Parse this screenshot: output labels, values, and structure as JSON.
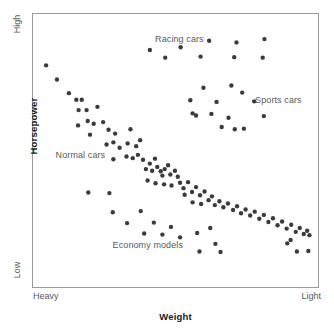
{
  "chart_data": {
    "type": "scatter",
    "title": "",
    "xlabel": "Weight",
    "ylabel": "Horsepower",
    "xlim": [
      0,
      100
    ],
    "ylim": [
      0,
      100
    ],
    "grid": false,
    "legend_position": "none",
    "x_tick_labels": [
      "Heavy",
      "Light"
    ],
    "y_tick_labels": [
      "Low",
      "High"
    ],
    "annotations": [
      {
        "text": "Racing cars",
        "x": 51.0,
        "y": 90.5
      },
      {
        "text": "Sports cars",
        "x": 85.5,
        "y": 68.5
      },
      {
        "text": "Normal cars",
        "x": 16.5,
        "y": 48.5
      },
      {
        "text": "Economy models",
        "x": 40.0,
        "y": 15.5
      }
    ],
    "marker": {
      "shape": "circle",
      "radius_px": 2.2,
      "color": "#3b3b3b"
    },
    "series": [
      {
        "name": "Normal cars",
        "points": [
          [
            4.6,
            81.2
          ],
          [
            8.4,
            76.0
          ],
          [
            12.6,
            71.0
          ],
          [
            15.2,
            68.6
          ],
          [
            17.1,
            68.6
          ],
          [
            16.0,
            64.8
          ],
          [
            18.8,
            64.8
          ],
          [
            22.6,
            66.0
          ],
          [
            15.8,
            59.2
          ],
          [
            19.2,
            60.8
          ],
          [
            21.3,
            59.8
          ],
          [
            24.6,
            60.4
          ],
          [
            20.0,
            55.8
          ],
          [
            26.5,
            57.6
          ],
          [
            28.8,
            56.2
          ],
          [
            34.2,
            57.8
          ],
          [
            25.8,
            52.2
          ],
          [
            28.2,
            53.0
          ],
          [
            30.4,
            51.0
          ],
          [
            33.2,
            52.6
          ],
          [
            36.2,
            51.6
          ],
          [
            37.6,
            53.8
          ],
          [
            28.2,
            46.8
          ],
          [
            32.8,
            47.8
          ],
          [
            35.0,
            47.2
          ],
          [
            36.8,
            48.4
          ],
          [
            38.6,
            46.6
          ],
          [
            41.0,
            45.2
          ],
          [
            42.8,
            47.0
          ],
          [
            39.6,
            43.2
          ],
          [
            41.8,
            42.6
          ],
          [
            43.6,
            44.0
          ],
          [
            44.8,
            42.4
          ],
          [
            46.2,
            43.2
          ],
          [
            47.4,
            44.6
          ],
          [
            45.4,
            40.8
          ],
          [
            48.2,
            41.2
          ],
          [
            49.8,
            42.6
          ],
          [
            50.8,
            40.4
          ],
          [
            40.2,
            39.0
          ],
          [
            43.0,
            38.0
          ],
          [
            46.0,
            37.6
          ],
          [
            48.6,
            37.2
          ],
          [
            51.6,
            38.2
          ],
          [
            52.8,
            36.2
          ],
          [
            54.4,
            38.4
          ],
          [
            53.2,
            33.8
          ],
          [
            55.8,
            34.8
          ],
          [
            57.2,
            36.6
          ],
          [
            58.6,
            33.6
          ],
          [
            60.2,
            35.0
          ],
          [
            56.0,
            31.0
          ],
          [
            59.0,
            30.4
          ],
          [
            61.6,
            31.8
          ],
          [
            62.8,
            33.2
          ],
          [
            63.8,
            30.0
          ],
          [
            65.4,
            31.4
          ],
          [
            66.8,
            29.2
          ],
          [
            68.4,
            30.6
          ],
          [
            70.2,
            28.2
          ],
          [
            71.6,
            29.6
          ],
          [
            73.0,
            27.0
          ],
          [
            74.6,
            28.4
          ],
          [
            76.2,
            26.2
          ],
          [
            77.8,
            27.6
          ],
          [
            79.4,
            25.0
          ],
          [
            81.0,
            26.4
          ],
          [
            82.6,
            23.8
          ],
          [
            84.2,
            25.2
          ],
          [
            85.8,
            22.6
          ],
          [
            87.4,
            24.0
          ],
          [
            89.0,
            21.4
          ],
          [
            90.6,
            22.8
          ],
          [
            92.2,
            20.2
          ],
          [
            93.6,
            21.6
          ],
          [
            95.0,
            19.4
          ],
          [
            96.2,
            20.6
          ],
          [
            97.0,
            19.0
          ]
        ]
      },
      {
        "name": "Racing cars",
        "points": [
          [
            41.0,
            86.8
          ],
          [
            51.8,
            87.8
          ],
          [
            61.8,
            90.2
          ],
          [
            71.4,
            89.6
          ],
          [
            81.2,
            90.8
          ],
          [
            46.4,
            84.0
          ],
          [
            58.8,
            84.4
          ],
          [
            70.6,
            84.2
          ],
          [
            80.6,
            84.0
          ]
        ]
      },
      {
        "name": "Sports cars",
        "points": [
          [
            59.8,
            73.0
          ],
          [
            69.6,
            73.8
          ],
          [
            73.4,
            71.2
          ],
          [
            55.2,
            68.4
          ],
          [
            64.4,
            67.8
          ],
          [
            77.6,
            68.0
          ],
          [
            57.2,
            62.8
          ],
          [
            62.6,
            63.4
          ],
          [
            68.6,
            62.0
          ],
          [
            81.0,
            62.6
          ],
          [
            66.2,
            58.6
          ],
          [
            70.8,
            57.8
          ],
          [
            56.0,
            63.6
          ],
          [
            74.0,
            58.0
          ]
        ]
      },
      {
        "name": "Economy models",
        "points": [
          [
            19.4,
            34.6
          ],
          [
            26.8,
            34.4
          ],
          [
            28.0,
            27.4
          ],
          [
            37.8,
            27.8
          ],
          [
            33.0,
            23.4
          ],
          [
            42.4,
            23.6
          ],
          [
            39.0,
            19.6
          ],
          [
            48.4,
            22.0
          ],
          [
            45.4,
            19.2
          ],
          [
            51.6,
            18.2
          ],
          [
            57.6,
            19.8
          ],
          [
            62.2,
            21.6
          ],
          [
            64.0,
            15.8
          ],
          [
            58.4,
            13.0
          ],
          [
            65.8,
            12.8
          ],
          [
            89.2,
            16.0
          ],
          [
            92.6,
            13.0
          ],
          [
            96.6,
            13.2
          ],
          [
            90.4,
            17.2
          ]
        ]
      }
    ]
  },
  "annotations_text": {
    "racing": "Racing cars",
    "sports": "Sports cars",
    "normal": "Normal cars",
    "economy": "Economy models"
  },
  "axes": {
    "x_title": "Weight",
    "y_title": "Horsepower",
    "x_min_label": "Heavy",
    "x_max_label": "Light",
    "y_min_label": "Low",
    "y_max_label": "High"
  },
  "colors": {
    "marker": "#3b3b3b",
    "frame": "#9a9a9a",
    "annotation_text": "#595959",
    "axis_title_text": "#1a1a1a",
    "background": "#ffffff"
  }
}
